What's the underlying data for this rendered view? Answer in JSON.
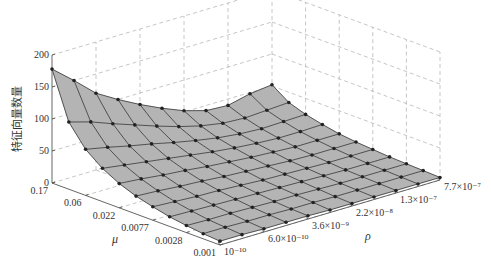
{
  "chart_data": {
    "type": "surface3d",
    "title": "",
    "zlabel": "特征向量数量",
    "xlabel": "μ",
    "ylabel": "ρ",
    "zlim": [
      0,
      200
    ],
    "z_ticks": [
      "0",
      "50",
      "100",
      "150",
      "200"
    ],
    "mu_ticks": [
      "0.17",
      "0.06",
      "0.022",
      "0.0077",
      "0.0028",
      "0.001"
    ],
    "rho_ticks": [
      "10⁻¹⁰",
      "6.0×10⁻¹⁰",
      "3.6×10⁻⁹",
      "2.2×10⁻⁸",
      "1.3×10⁻⁷",
      "7.7×10⁻⁷"
    ],
    "grid": true,
    "surface_color": "#b4b4b4",
    "edge_color": "#333333",
    "marker_color": "#222222",
    "mu_values": [
      0.17,
      0.1,
      0.06,
      0.035,
      0.022,
      0.013,
      0.0077,
      0.0046,
      0.0028,
      0.0017,
      0.001
    ],
    "rho_values": [
      "1e-10",
      "2.4e-10",
      "6.0e-10",
      "1.5e-9",
      "3.6e-9",
      "8.9e-9",
      "2.2e-8",
      "5.3e-8",
      "1.3e-7",
      "3.2e-7",
      "7.7e-7"
    ],
    "z_values": [
      [
        178,
        150,
        120,
        100,
        82,
        66,
        52,
        42,
        40,
        48,
        52
      ],
      [
        105,
        95,
        82,
        70,
        58,
        47,
        38,
        32,
        30,
        32,
        34
      ],
      [
        72,
        65,
        57,
        50,
        42,
        35,
        29,
        25,
        23,
        24,
        25
      ],
      [
        52,
        47,
        42,
        37,
        32,
        27,
        23,
        20,
        18,
        18,
        19
      ],
      [
        38,
        35,
        31,
        28,
        24,
        21,
        18,
        16,
        14,
        14,
        14
      ],
      [
        28,
        26,
        23,
        21,
        18,
        16,
        14,
        12,
        11,
        11,
        11
      ],
      [
        21,
        19,
        17,
        16,
        14,
        12,
        11,
        10,
        9,
        9,
        9
      ],
      [
        15,
        14,
        13,
        12,
        11,
        10,
        9,
        8,
        7,
        7,
        7
      ],
      [
        11,
        10,
        10,
        9,
        8,
        8,
        7,
        6,
        6,
        6,
        6
      ],
      [
        8,
        8,
        7,
        7,
        6,
        6,
        5,
        5,
        5,
        5,
        5
      ],
      [
        6,
        6,
        5,
        5,
        5,
        4,
        4,
        4,
        4,
        4,
        4
      ]
    ]
  }
}
